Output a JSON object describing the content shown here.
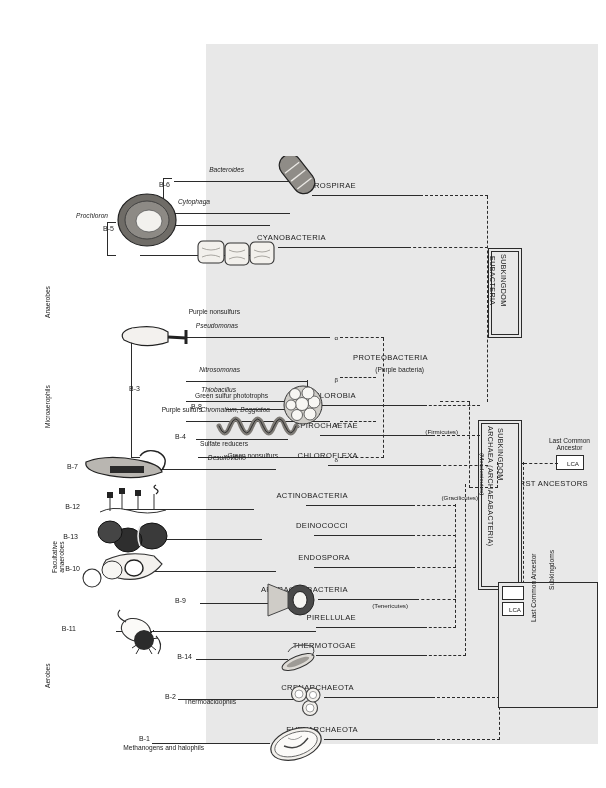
{
  "figure": {
    "orientation_note": "printed upside-down (rotated 180 degrees)",
    "shade_color": "#e8e8e8",
    "line_color": "#2b2b2b"
  },
  "oxygen_axis": {
    "labels": [
      {
        "id": "aerobes",
        "text": "Aerobes"
      },
      {
        "id": "facultative",
        "text": "Facultative\nanaerobes"
      },
      {
        "id": "microaerophils",
        "text": "Microaerophils"
      },
      {
        "id": "anaerobes",
        "text": "Anaerobes"
      }
    ]
  },
  "root": {
    "first_ancestors": "FIRST ANCESTORS",
    "lca_tag": "LCA",
    "lca_caption": "Last Common\nAncestor"
  },
  "subkingdoms": [
    {
      "id": "eubacteria",
      "line1": "SUBKINGDOM",
      "line2": "EUBACTERIA",
      "line3": ""
    },
    {
      "id": "archaea",
      "line1": "SUBKINGDOM",
      "line2": "ARCHAEA (ARCHAEABACTERIA)",
      "line3": "(Mendosicutes)"
    }
  ],
  "divisions": [
    {
      "id": "gracilicutes",
      "text": "(Gracilicutes)"
    },
    {
      "id": "firmicutes",
      "text": "(Firmicutes)"
    },
    {
      "id": "tenericutes",
      "text": "(Tenericutes)"
    }
  ],
  "phyla": [
    {
      "code": "B-1",
      "name": "EURYARCHAEOTA",
      "sub": "Methanogens and halophils",
      "genera": []
    },
    {
      "code": "B-2",
      "name": "CRENARCHAEOTA",
      "sub": "Thermoacidophils",
      "genera": []
    },
    {
      "code": "B-14",
      "name": "THERMOTOGAE",
      "sub": "",
      "genera": []
    },
    {
      "code": "B-11",
      "name": "PIRELLULAE",
      "sub": "",
      "genera": []
    },
    {
      "code": "B-9",
      "name": "APHRAGMABACTERIA",
      "sub": "",
      "genera": []
    },
    {
      "code": "B-10",
      "name": "ENDOSPORA",
      "sub": "",
      "genera": []
    },
    {
      "code": "B-13",
      "name": "DEINOCOCCI",
      "sub": "",
      "genera": []
    },
    {
      "code": "B-12",
      "name": "ACTINOBACTERIA",
      "sub": "",
      "genera": []
    },
    {
      "code": "B-7",
      "name": "CHLOROFLEXA",
      "sub": "Green nonsulfurs",
      "genera": []
    },
    {
      "code": "B-4",
      "name": "SPIROCHAETAE",
      "sub": "",
      "genera": []
    },
    {
      "code": "B-8",
      "name": "CHLOROBIA",
      "sub": "Green sulfur phototrophs",
      "genera": []
    },
    {
      "code": "B-3",
      "name": "PROTEOBACTERIA",
      "sub": "(Purple bacteria)",
      "genera": [
        "Desulfovibrio",
        "Chromatium, Beggiatoa",
        "Thiobacillus",
        "Nitrosomonas",
        "Pseudomonas"
      ]
    },
    {
      "code": "B-5",
      "name": "CYANOBACTERIA",
      "sub": "",
      "genera": [
        "Prochloron"
      ]
    },
    {
      "code": "B-6",
      "name": "SAPROSPIRAE",
      "sub": "",
      "genera": [
        "Cytophaga",
        "Bacteroides"
      ]
    }
  ],
  "proteobacteria_branches": [
    {
      "greek": "δ",
      "label": "Sulfate reducers",
      "genus": "Desulfovibrio"
    },
    {
      "greek": "γ",
      "label": "Purple sulfurs",
      "genus": "Chromatium, Beggiatoa"
    },
    {
      "greek": "β",
      "label": "",
      "genus": "Thiobacillus"
    },
    {
      "greek": "β",
      "label": "",
      "genus": "Nitrosomonas"
    },
    {
      "greek": "α",
      "label": "Purple nonsulfurs",
      "genus": "Pseudomonas"
    }
  ],
  "legend": {
    "rows": [
      {
        "symbol": "LCA",
        "text": "Last Common Ancestor"
      },
      {
        "symbol": "",
        "text": "Subkingdoms"
      }
    ]
  }
}
